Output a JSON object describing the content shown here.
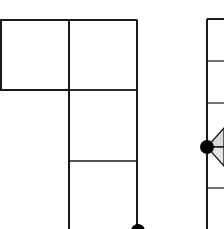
{
  "figure": {
    "background": "#ffffff",
    "stroke_color": "#1a1a1a",
    "fill_light": "#d8d8d8",
    "left_shape": {
      "description": "L-shaped grid of square cells",
      "cells": [
        {
          "row": 0,
          "col": 0
        },
        {
          "row": 0,
          "col": 1
        },
        {
          "row": 1,
          "col": 1
        },
        {
          "row": 2,
          "col": 1
        }
      ],
      "node": {
        "position": "bottom-right corner",
        "shape": "filled circle"
      }
    },
    "right_shape": {
      "description": "vertical strip of cells with a node and fan of shaded triangles",
      "node": {
        "position": "left edge middle",
        "shape": "filled circle"
      }
    }
  }
}
